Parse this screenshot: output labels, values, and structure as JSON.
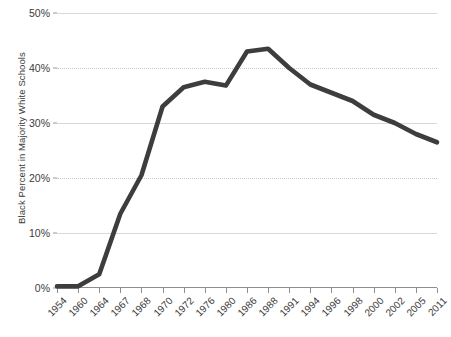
{
  "chart_data": {
    "type": "line",
    "title": "",
    "xlabel": "",
    "ylabel": "Black Percent in Majority White Schools",
    "ylim": [
      0,
      50
    ],
    "ytick_labels": [
      "0%",
      "10%",
      "20%",
      "30%",
      "40%",
      "50%"
    ],
    "ytick_values": [
      0,
      10,
      20,
      30,
      40,
      50
    ],
    "grid": true,
    "legend": "none",
    "categories": [
      "1954",
      "1960",
      "1964",
      "1967",
      "1968",
      "1970",
      "1972",
      "1976",
      "1980",
      "1986",
      "1988",
      "1991",
      "1994",
      "1996",
      "1998",
      "2000",
      "2002",
      "2005",
      "2011"
    ],
    "values": [
      0.3,
      0.3,
      2.5,
      13.5,
      20.5,
      33.0,
      36.5,
      37.5,
      36.8,
      43.0,
      43.5,
      40.0,
      37.0,
      35.5,
      34.0,
      31.5,
      30.0,
      28.0,
      26.5
    ],
    "series": [
      {
        "name": "Black Percent in Majority White Schools",
        "color": "#3d3d3d",
        "values": [
          0.3,
          0.3,
          2.5,
          13.5,
          20.5,
          33.0,
          36.5,
          37.5,
          36.8,
          43.0,
          43.5,
          40.0,
          37.0,
          35.5,
          34.0,
          31.5,
          30.0,
          28.0,
          26.5
        ]
      }
    ]
  },
  "style": {
    "line_color": "#3d3d3d",
    "grid_color": "#c9c9c9",
    "axis_color": "#8e8e8e",
    "text_color": "#3b3b3b",
    "background": "#ffffff"
  }
}
